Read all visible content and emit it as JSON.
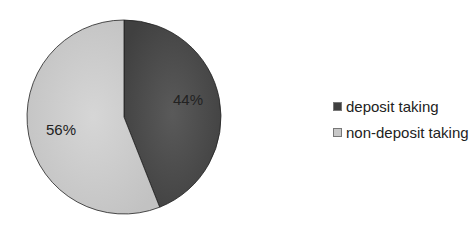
{
  "chart_data": {
    "type": "pie",
    "title": "",
    "categories": [
      "deposit taking",
      "non-deposit taking"
    ],
    "values": [
      44,
      56
    ],
    "labels": [
      "44%",
      "56%"
    ],
    "colors": [
      "#4a4a4a",
      "#cdcdcd"
    ],
    "legend_position": "right",
    "start_angle_deg": 0,
    "direction": "clockwise"
  },
  "legend": {
    "items": [
      {
        "label": "deposit taking",
        "color": "#3f3f3f"
      },
      {
        "label": "non-deposit taking",
        "color": "#c8c8c8"
      }
    ]
  }
}
